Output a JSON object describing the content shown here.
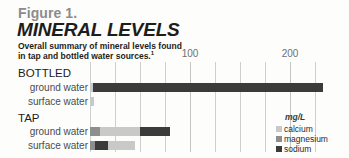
{
  "figure": {
    "label": "Figure 1.",
    "title": "MINERAL LEVELS",
    "subtitle_line1": "Overall summary of mineral levels found",
    "subtitle_line2": "in tap and bottled water sources.",
    "subtitle_footnote_marker": "1"
  },
  "legend": {
    "unit": "mg/L",
    "items": [
      {
        "label": "calcium",
        "color": "#c9c9c9"
      },
      {
        "label": "magnesium",
        "color": "#8e8e8e"
      },
      {
        "label": "sodium",
        "color": "#3b3b3b"
      }
    ]
  },
  "groups": [
    {
      "name": "BOTTLED"
    },
    {
      "name": "TAP"
    }
  ],
  "rows": [
    {
      "label": "ground water"
    },
    {
      "label": "surface water"
    },
    {
      "label": "ground water"
    },
    {
      "label": "surface water"
    }
  ],
  "axis": {
    "ticks_labeled": [
      {
        "value": 100,
        "label": "100"
      },
      {
        "value": 200,
        "label": "200"
      }
    ],
    "gridline_values": [
      0,
      25,
      50,
      75,
      100,
      125,
      150,
      175,
      200,
      225
    ]
  },
  "chart_data": {
    "type": "bar",
    "orientation": "horizontal",
    "stacked": true,
    "title": "MINERAL LEVELS",
    "subtitle": "Overall summary of mineral levels found in tap and bottled water sources.",
    "xlabel": "mg/L",
    "ylabel": "",
    "xlim": [
      0,
      233
    ],
    "xticks": [
      0,
      25,
      50,
      75,
      100,
      125,
      150,
      175,
      200,
      225
    ],
    "xtick_labels": [
      "",
      "",
      "",
      "",
      "100",
      "",
      "",
      "",
      "200",
      ""
    ],
    "grid": true,
    "legend_position": "right",
    "group_order": [
      "BOTTLED",
      "TAP"
    ],
    "categories": [
      "BOTTLED ground water",
      "BOTTLED surface water",
      "TAP ground water",
      "TAP surface water"
    ],
    "series": [
      {
        "name": "calcium",
        "color": "#c9c9c9",
        "values": [
          3,
          4,
          40,
          27
        ]
      },
      {
        "name": "magnesium",
        "color": "#8e8e8e",
        "values": [
          0,
          0,
          10,
          5
        ]
      },
      {
        "name": "sodium",
        "color": "#3b3b3b",
        "values": [
          230,
          0,
          30,
          13
        ]
      }
    ],
    "stack_order": [
      [
        "calcium",
        "sodium"
      ],
      [
        "calcium"
      ],
      [
        "magnesium",
        "calcium",
        "sodium"
      ],
      [
        "magnesium",
        "sodium",
        "calcium"
      ]
    ],
    "row_totals": [
      233,
      4,
      80,
      45
    ],
    "units": "mg/L"
  }
}
